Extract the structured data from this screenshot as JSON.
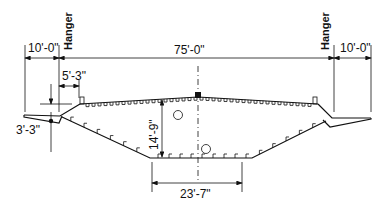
{
  "diagram": {
    "type": "bridge-cross-section",
    "labels": {
      "left_overhang": "10'-0\"",
      "main_span": "75'-0\"",
      "right_overhang": "10'-0\"",
      "hanger_left": "Hanger",
      "hanger_right": "Hanger",
      "edge_offset": "5'-3\"",
      "wing_depth": "3'-3\"",
      "box_depth": "14'-9\"",
      "bottom_width": "23'-7\""
    },
    "stroke_color": "#111111",
    "background_color": "#ffffff"
  }
}
